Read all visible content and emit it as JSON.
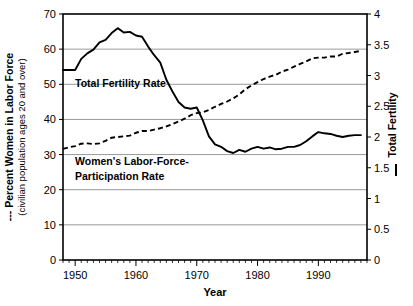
{
  "chart_data": {
    "type": "line",
    "title": "",
    "xlabel": "Year",
    "xlim": [
      1948,
      1998
    ],
    "xticks": [
      1950,
      1960,
      1970,
      1980,
      1990
    ],
    "xticklabels": [
      "1950",
      "1960",
      "1970",
      "1980",
      "1990"
    ],
    "grid": true,
    "legend_position": "inside-plot-annotations",
    "axes": {
      "left": {
        "label_line1": "--- Percent Women in Labor Force",
        "label_line2": "(civilian population ages 20 and over)",
        "key_style": "dashed",
        "ylim": [
          0,
          70
        ],
        "yticks": [
          0,
          10,
          20,
          30,
          40,
          50,
          60,
          70
        ],
        "yticklabels": [
          "0",
          "10",
          "20",
          "30",
          "40",
          "50",
          "60",
          "70"
        ]
      },
      "right": {
        "label": "Total Fertility",
        "key_style": "solid",
        "ylim": [
          0,
          4
        ],
        "yticks": [
          0,
          0.5,
          1,
          1.5,
          2,
          2.5,
          3,
          3.5,
          4
        ],
        "yticklabels": [
          "0",
          "0.5",
          "1",
          "1.5",
          "2",
          "2.5",
          "3",
          "3.5",
          "4"
        ]
      }
    },
    "series": [
      {
        "name": "Total Fertility Rate",
        "annotation": "Total Fertility Rate",
        "style": "solid",
        "axis": "right",
        "x": [
          1948,
          1949,
          1950,
          1951,
          1952,
          1953,
          1954,
          1955,
          1956,
          1957,
          1958,
          1959,
          1960,
          1961,
          1962,
          1963,
          1964,
          1965,
          1966,
          1967,
          1968,
          1969,
          1970,
          1971,
          1972,
          1973,
          1974,
          1975,
          1976,
          1977,
          1978,
          1979,
          1980,
          1981,
          1982,
          1983,
          1984,
          1985,
          1986,
          1987,
          1988,
          1989,
          1990,
          1991,
          1992,
          1993,
          1994,
          1995,
          1996,
          1997
        ],
        "values": [
          3.09,
          3.09,
          3.09,
          3.27,
          3.36,
          3.42,
          3.54,
          3.58,
          3.69,
          3.77,
          3.7,
          3.71,
          3.65,
          3.63,
          3.47,
          3.33,
          3.21,
          2.93,
          2.74,
          2.57,
          2.48,
          2.46,
          2.48,
          2.27,
          2.01,
          1.88,
          1.84,
          1.77,
          1.74,
          1.79,
          1.76,
          1.81,
          1.84,
          1.81,
          1.83,
          1.8,
          1.81,
          1.84,
          1.84,
          1.87,
          1.93,
          2.01,
          2.08,
          2.06,
          2.05,
          2.02,
          2.0,
          2.02,
          2.03,
          2.03
        ]
      },
      {
        "name": "Women's Labor-Force-Participation Rate",
        "annotation_line1": "Women's Labor-Force-",
        "annotation_line2": "Participation Rate",
        "style": "dashed",
        "axis": "left",
        "x": [
          1948,
          1949,
          1950,
          1951,
          1952,
          1953,
          1954,
          1955,
          1956,
          1957,
          1958,
          1959,
          1960,
          1961,
          1962,
          1963,
          1964,
          1965,
          1966,
          1967,
          1968,
          1969,
          1970,
          1971,
          1972,
          1973,
          1974,
          1975,
          1976,
          1977,
          1978,
          1979,
          1980,
          1981,
          1982,
          1983,
          1984,
          1985,
          1986,
          1987,
          1988,
          1989,
          1990,
          1991,
          1992,
          1993,
          1994,
          1995,
          1996,
          1997
        ],
        "values": [
          31.6,
          32.1,
          32.4,
          33.1,
          33.2,
          33.0,
          33.2,
          33.9,
          34.8,
          35.0,
          35.2,
          35.4,
          36.2,
          36.7,
          36.7,
          37.1,
          37.5,
          38.0,
          38.7,
          39.4,
          40.2,
          41.2,
          41.8,
          42.0,
          42.7,
          43.6,
          44.4,
          45.1,
          46.0,
          47.1,
          48.6,
          49.7,
          50.6,
          51.5,
          52.2,
          52.7,
          53.6,
          54.2,
          55.0,
          55.8,
          56.5,
          57.4,
          57.6,
          57.6,
          57.9,
          57.9,
          58.7,
          58.9,
          59.2,
          59.5
        ]
      }
    ]
  }
}
